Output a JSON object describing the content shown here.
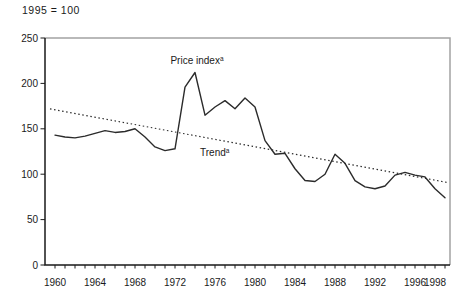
{
  "header": {
    "note": "1995 = 100"
  },
  "chart_data": {
    "type": "line",
    "title": "",
    "note": "1995 = 100",
    "xlabel": "",
    "ylabel": "",
    "ylim": [
      0,
      250
    ],
    "yticks": [
      0,
      50,
      100,
      150,
      200,
      250
    ],
    "x_range": [
      1960,
      1999
    ],
    "xtick_label_years": [
      1960,
      1964,
      1968,
      1972,
      1976,
      1980,
      1984,
      1988,
      1992,
      1996,
      1998
    ],
    "grid": false,
    "legend_position": "inline-annotations",
    "years": [
      1960,
      1961,
      1962,
      1963,
      1964,
      1965,
      1966,
      1967,
      1968,
      1969,
      1970,
      1971,
      1972,
      1973,
      1974,
      1975,
      1976,
      1977,
      1978,
      1979,
      1980,
      1981,
      1982,
      1983,
      1984,
      1985,
      1986,
      1987,
      1988,
      1989,
      1990,
      1991,
      1992,
      1993,
      1994,
      1995,
      1996,
      1997,
      1998,
      1999
    ],
    "series": [
      {
        "name": "Price index",
        "footnote_mark": "a",
        "style": "solid",
        "color": "#2b2b2b",
        "values": [
          143,
          141,
          140,
          142,
          145,
          148,
          146,
          147,
          150,
          141,
          130,
          126,
          128,
          196,
          212,
          165,
          174,
          181,
          172,
          184,
          174,
          137,
          122,
          123,
          106,
          93,
          92,
          100,
          122,
          112,
          93,
          86,
          84,
          87,
          99,
          102,
          99,
          97,
          84,
          74
        ]
      },
      {
        "name": "Trend",
        "footnote_mark": "a",
        "style": "dotted",
        "color": "#2b2b2b",
        "trend_endpoints": {
          "start_year": 1959.5,
          "start_value": 172,
          "end_year": 1999.2,
          "end_value": 91
        }
      }
    ]
  }
}
